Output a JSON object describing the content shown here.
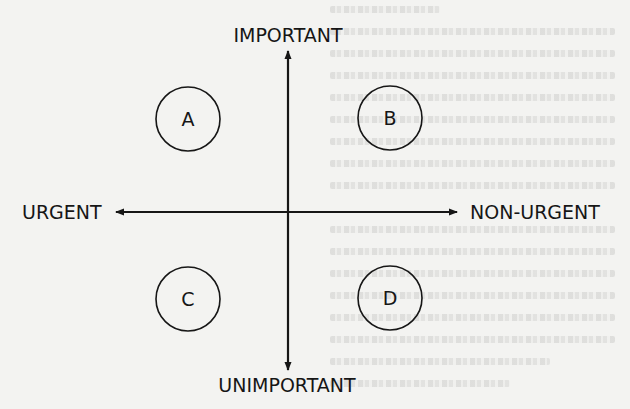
{
  "diagram": {
    "axes": {
      "top_label": "IMPORTANT",
      "bottom_label": "UNIMPORTANT",
      "left_label": "URGENT",
      "right_label": "NON-URGENT"
    },
    "quadrants": [
      {
        "id": "A",
        "label": "A",
        "position": "important-urgent"
      },
      {
        "id": "B",
        "label": "B",
        "position": "important-non-urgent"
      },
      {
        "id": "C",
        "label": "C",
        "position": "unimportant-urgent"
      },
      {
        "id": "D",
        "label": "D",
        "position": "unimportant-non-urgent"
      }
    ],
    "colors": {
      "ink": "#161616",
      "paper": "#f3f3f1",
      "bleed_through": "#969694"
    },
    "icons": {
      "arrow_up": "arrow-up-icon",
      "arrow_down": "arrow-down-icon",
      "arrow_left": "arrow-left-icon",
      "arrow_right": "arrow-right-icon"
    }
  }
}
